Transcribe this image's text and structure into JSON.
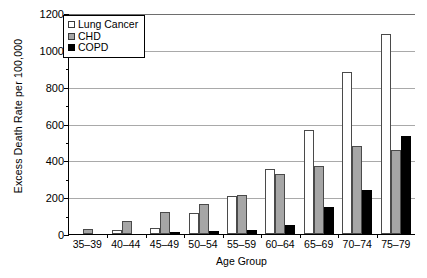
{
  "chart_data": {
    "type": "bar",
    "title": "",
    "xlabel": "Age Group",
    "ylabel": "Excess Death Rate per 100,000",
    "categories": [
      "35–39",
      "40–44",
      "45–49",
      "50–54",
      "55–59",
      "60–64",
      "65–69",
      "70–74",
      "75–79"
    ],
    "series": [
      {
        "name": "Lung Cancer",
        "color": "#ffffff",
        "values": [
          0,
          20,
          35,
          115,
          205,
          355,
          565,
          880,
          1085
        ]
      },
      {
        "name": "CHD",
        "color": "#a6a6a6",
        "values": [
          25,
          70,
          120,
          165,
          210,
          325,
          370,
          480,
          455
        ]
      },
      {
        "name": "COPD",
        "color": "#000000",
        "values": [
          0,
          0,
          5,
          15,
          20,
          50,
          145,
          240,
          530
        ]
      }
    ],
    "ylim": [
      0,
      1200
    ],
    "yticks": [
      0,
      200,
      400,
      600,
      800,
      1000,
      1200
    ],
    "ytick_labels": [
      "0",
      "200",
      "400",
      "600",
      "800",
      "1000",
      "1200"
    ],
    "grid": true,
    "legend_position": "top-left-inside"
  },
  "legend": {
    "items": [
      {
        "label": "Lung Cancer"
      },
      {
        "label": "CHD"
      },
      {
        "label": "COPD"
      }
    ]
  }
}
